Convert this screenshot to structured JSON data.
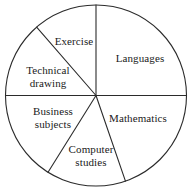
{
  "chart_data": {
    "type": "pie",
    "title": "",
    "subtitle": "",
    "xlabel": "",
    "ylabel": "",
    "legend_position": "none",
    "grid": false,
    "units": "degrees",
    "total_degrees": 360,
    "categories": [
      "Languages",
      "Mathematics",
      "Computer studies",
      "Business subjects",
      "Technical drawing",
      "Exercise"
    ],
    "values": [
      90,
      71,
      51,
      58,
      49,
      41
    ],
    "percentages": [
      25,
      19.7,
      14.2,
      16.1,
      13.6,
      11.4
    ],
    "slices": [
      {
        "label": "Languages",
        "label_lines": [
          "Languages"
        ],
        "start_angle_deg": 0,
        "end_angle_deg": 90,
        "sweep_deg": 90,
        "percent": 25,
        "label_x": 140,
        "label_y": 58
      },
      {
        "label": "Mathematics",
        "label_lines": [
          "Mathematics"
        ],
        "start_angle_deg": 289,
        "end_angle_deg": 360,
        "sweep_deg": 71,
        "percent": 19.7,
        "label_x": 138,
        "label_y": 118
      },
      {
        "label": "Computer studies",
        "label_lines": [
          "Computer",
          "studies"
        ],
        "start_angle_deg": 238,
        "end_angle_deg": 289,
        "sweep_deg": 51,
        "percent": 14.2,
        "label_x": 91,
        "label_y": 155
      },
      {
        "label": "Business subjects",
        "label_lines": [
          "Business",
          "subjects"
        ],
        "start_angle_deg": 180,
        "end_angle_deg": 238,
        "sweep_deg": 58,
        "percent": 16.1,
        "label_x": 53,
        "label_y": 117
      },
      {
        "label": "Technical drawing",
        "label_lines": [
          "Technical",
          "drawing"
        ],
        "start_angle_deg": 131,
        "end_angle_deg": 180,
        "sweep_deg": 49,
        "percent": 13.6,
        "label_x": 48,
        "label_y": 76
      },
      {
        "label": "Exercise",
        "label_lines": [
          "Exercise"
        ],
        "start_angle_deg": 90,
        "end_angle_deg": 131,
        "sweep_deg": 41,
        "percent": 11.4,
        "label_x": 74,
        "label_y": 41
      }
    ],
    "geometry": {
      "center_x": 96,
      "center_y": 95.5,
      "radius": 90.5
    },
    "colors": {
      "stroke": "#2b2b2b",
      "fill": "#ffffff",
      "text": "#1a1a1a",
      "background": "#ffffff"
    }
  }
}
